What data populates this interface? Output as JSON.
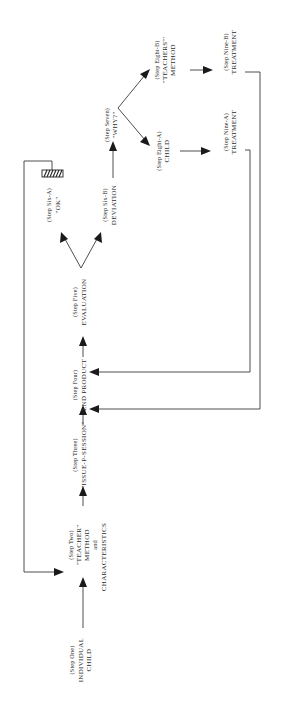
{
  "diagram": {
    "orientation": "rotated-90-ccw",
    "nodes": [
      {
        "id": "step1",
        "step": "(Step One)",
        "lines": [
          "INDIVIDUAL",
          "CHILD"
        ]
      },
      {
        "id": "step2",
        "step": "(Step Two)",
        "lines": [
          "\"TEACHER\"",
          "METHOD",
          "and",
          "CHARACTERISTICS"
        ]
      },
      {
        "id": "step3",
        "step": "(Step Three)",
        "lines": [
          "\"ISSUE-P-SESSION\""
        ]
      },
      {
        "id": "step4",
        "step": "(Step Four)",
        "lines": [
          "END PRODUCT"
        ]
      },
      {
        "id": "step5",
        "step": "(Step Five)",
        "lines": [
          "EVALUATION"
        ]
      },
      {
        "id": "step6a",
        "step": "(Step Six-A)",
        "lines": [
          "\"OK\""
        ]
      },
      {
        "id": "step6b",
        "step": "(Step Six-B)",
        "lines": [
          "DEVIATION"
        ]
      },
      {
        "id": "step7",
        "step": "(Step Seven)",
        "lines": [
          "\"WHY?\""
        ]
      },
      {
        "id": "step8a",
        "step": "(Step Eight-A)",
        "lines": [
          "CHILD"
        ]
      },
      {
        "id": "step8b",
        "step": "(Step Eight-B)",
        "lines": [
          "\"TEACHERS'\"",
          "METHOD"
        ]
      },
      {
        "id": "step9a",
        "step": "(Step Nine-A)",
        "lines": [
          "TREATMENT"
        ]
      },
      {
        "id": "step9b",
        "step": "(Step Nine-B)",
        "lines": [
          "TREATMENT"
        ]
      }
    ],
    "edges": [
      {
        "from": "step1",
        "to": "step2"
      },
      {
        "from": "step2",
        "to": "step3"
      },
      {
        "from": "step3",
        "to": "step4"
      },
      {
        "from": "step4",
        "to": "step5"
      },
      {
        "from": "step5",
        "to": "step6a"
      },
      {
        "from": "step5",
        "to": "step6b"
      },
      {
        "from": "step6b",
        "to": "step7"
      },
      {
        "from": "step7",
        "to": "step8a"
      },
      {
        "from": "step7",
        "to": "step8b"
      },
      {
        "from": "step8a",
        "to": "step9a"
      },
      {
        "from": "step8b",
        "to": "step9b"
      },
      {
        "from": "step9a",
        "to": "step4",
        "type": "feedback"
      },
      {
        "from": "step9b",
        "to": "step4",
        "type": "feedback"
      },
      {
        "from": "step6a",
        "to": "step2",
        "type": "feedback"
      }
    ],
    "marker": {
      "type": "hatched-box",
      "near": "step6a"
    },
    "colors": {
      "line": "#3a3a3a",
      "text": "#2a2a2a",
      "background": "#ffffff"
    }
  }
}
